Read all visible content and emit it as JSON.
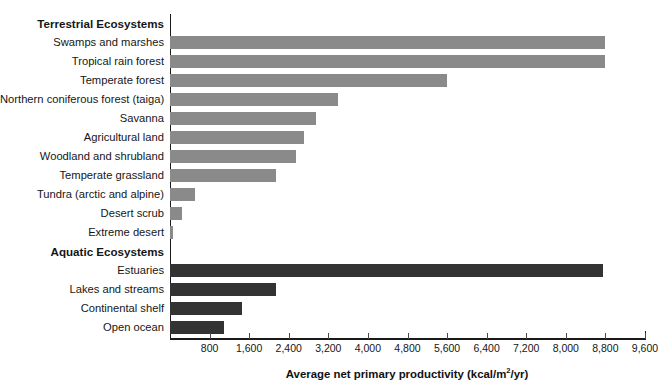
{
  "chart_data": {
    "type": "bar",
    "orientation": "horizontal",
    "title": "",
    "xlabel": "Average net primary productivity (kcal/m2/yr)",
    "xlabel_parts": {
      "before": "Average net primary productivity (kcal/m",
      "sup": "2",
      "after": "/yr)"
    },
    "ylabel": "",
    "xlim": [
      0,
      9600
    ],
    "xticks": [
      800,
      1600,
      2400,
      3200,
      4000,
      4800,
      5600,
      6400,
      7200,
      8000,
      8800,
      9600
    ],
    "xtick_labels": [
      "800",
      "1,600",
      "2,400",
      "3,200",
      "4,000",
      "4,800",
      "5,600",
      "6,400",
      "7,200",
      "8,000",
      "8,800",
      "9,600"
    ],
    "grid": false,
    "legend": null,
    "groups": [
      {
        "name": "Terrestrial Ecosystems",
        "color": "#8a8a8a",
        "categories": [
          "Swamps and marshes",
          "Tropical rain forest",
          "Temperate forest",
          "Northern coniferous forest (taiga)",
          "Savanna",
          "Agricultural land",
          "Woodland and shrubland",
          "Temperate grassland",
          "Tundra (arctic and alpine)",
          "Desert scrub",
          "Extreme desert"
        ],
        "values": [
          8800,
          8800,
          5600,
          3400,
          2950,
          2700,
          2550,
          2150,
          500,
          250,
          60
        ]
      },
      {
        "name": "Aquatic Ecosystems",
        "color": "#333333",
        "categories": [
          "Estuaries",
          "Lakes and streams",
          "Continental shelf",
          "Open ocean"
        ],
        "values": [
          8750,
          2150,
          1450,
          1100
        ]
      }
    ],
    "rows": [
      {
        "kind": "header",
        "label": "Terrestrial Ecosystems"
      },
      {
        "kind": "bar",
        "label": "Swamps and marshes",
        "value": 8800,
        "series": "terrestrial"
      },
      {
        "kind": "bar",
        "label": "Tropical rain forest",
        "value": 8800,
        "series": "terrestrial"
      },
      {
        "kind": "bar",
        "label": "Temperate forest",
        "value": 5600,
        "series": "terrestrial"
      },
      {
        "kind": "bar",
        "label": "Northern coniferous forest (taiga)",
        "value": 3400,
        "series": "terrestrial"
      },
      {
        "kind": "bar",
        "label": "Savanna",
        "value": 2950,
        "series": "terrestrial"
      },
      {
        "kind": "bar",
        "label": "Agricultural land",
        "value": 2700,
        "series": "terrestrial"
      },
      {
        "kind": "bar",
        "label": "Woodland and shrubland",
        "value": 2550,
        "series": "terrestrial"
      },
      {
        "kind": "bar",
        "label": "Temperate grassland",
        "value": 2150,
        "series": "terrestrial"
      },
      {
        "kind": "bar",
        "label": "Tundra (arctic and alpine)",
        "value": 500,
        "series": "terrestrial"
      },
      {
        "kind": "bar",
        "label": "Desert scrub",
        "value": 250,
        "series": "terrestrial"
      },
      {
        "kind": "bar",
        "label": "Extreme desert",
        "value": 60,
        "series": "terrestrial"
      },
      {
        "kind": "header",
        "label": "Aquatic Ecosystems"
      },
      {
        "kind": "bar",
        "label": "Estuaries",
        "value": 8750,
        "series": "aquatic"
      },
      {
        "kind": "bar",
        "label": "Lakes and streams",
        "value": 2150,
        "series": "aquatic"
      },
      {
        "kind": "bar",
        "label": "Continental shelf",
        "value": 1450,
        "series": "aquatic"
      },
      {
        "kind": "bar",
        "label": "Open ocean",
        "value": 1100,
        "series": "aquatic"
      }
    ]
  },
  "colors": {
    "terrestrial_bar": "#8a8a8a",
    "aquatic_bar": "#333333",
    "axis": "#1a1a1a",
    "text": "#161616",
    "background": "#ffffff"
  }
}
